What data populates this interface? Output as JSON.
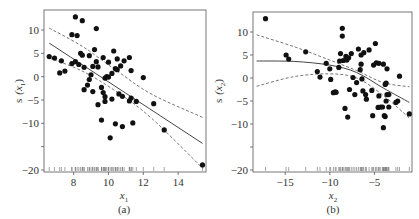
{
  "chart_data": [
    {
      "type": "scatter",
      "panel": "(a)",
      "xlabel": "x1",
      "ylabel": "s (x1)",
      "caption": "(a)",
      "xlim": [
        6.3,
        15.6
      ],
      "ylim": [
        -21,
        14
      ],
      "xticks": [
        8,
        10,
        12,
        14
      ],
      "yticks": [
        10,
        5,
        0,
        -5,
        -10,
        -15,
        -20
      ],
      "ytick_labels": [
        "10",
        "5",
        "0",
        "−5",
        "−10",
        "",
        "−20"
      ],
      "rug": true,
      "points": [
        [
          6.6,
          4.3
        ],
        [
          6.9,
          4.0
        ],
        [
          7.2,
          0.8
        ],
        [
          7.3,
          3.4
        ],
        [
          7.5,
          1.2
        ],
        [
          7.9,
          2.8
        ],
        [
          7.9,
          9.0
        ],
        [
          8.1,
          12.8
        ],
        [
          8.1,
          3.2
        ],
        [
          8.2,
          8.8
        ],
        [
          8.3,
          2.6
        ],
        [
          8.4,
          5.0
        ],
        [
          8.5,
          4.6
        ],
        [
          8.5,
          12.0
        ],
        [
          8.6,
          -2.8
        ],
        [
          8.6,
          2.0
        ],
        [
          8.8,
          -1.8
        ],
        [
          8.9,
          4.5
        ],
        [
          8.9,
          -0.6
        ],
        [
          9.0,
          0.4
        ],
        [
          9.1,
          -3.2
        ],
        [
          9.1,
          2.2
        ],
        [
          9.2,
          5.8
        ],
        [
          9.3,
          10.3
        ],
        [
          9.3,
          3.2
        ],
        [
          9.4,
          2.1
        ],
        [
          9.4,
          -6.0
        ],
        [
          9.6,
          -2.3
        ],
        [
          9.6,
          -9.3
        ],
        [
          9.7,
          -3.4
        ],
        [
          9.7,
          4.1
        ],
        [
          9.8,
          -0.3
        ],
        [
          9.8,
          -5.3
        ],
        [
          9.8,
          -4.3
        ],
        [
          9.9,
          0.0
        ],
        [
          10.0,
          3.1
        ],
        [
          10.0,
          -0.1
        ],
        [
          10.1,
          -13.1
        ],
        [
          10.2,
          -4.8
        ],
        [
          10.2,
          0.7
        ],
        [
          10.3,
          5.5
        ],
        [
          10.4,
          1.7
        ],
        [
          10.4,
          -10.1
        ],
        [
          10.5,
          3.8
        ],
        [
          10.5,
          1.5
        ],
        [
          10.6,
          -3.7
        ],
        [
          10.7,
          2.3
        ],
        [
          10.8,
          -4.2
        ],
        [
          10.8,
          -10.7
        ],
        [
          10.9,
          3.4
        ],
        [
          11.2,
          -5.2
        ],
        [
          11.2,
          4.1
        ],
        [
          11.3,
          1.3
        ],
        [
          11.3,
          -4.6
        ],
        [
          11.4,
          -9.9
        ],
        [
          11.6,
          -5.3
        ],
        [
          12.0,
          -0.2
        ],
        [
          12.6,
          -5.8
        ],
        [
          13.2,
          -11.4
        ],
        [
          15.4,
          -18.9
        ]
      ],
      "fit_line": [
        [
          6.6,
          7.2
        ],
        [
          15.4,
          -14.3
        ]
      ],
      "upper_band": [
        [
          6.6,
          10.4
        ],
        [
          8.5,
          6.5
        ],
        [
          10.5,
          1.2
        ],
        [
          12.5,
          -3.8
        ],
        [
          15.4,
          -8.7
        ]
      ],
      "lower_band": [
        [
          6.6,
          4.0
        ],
        [
          8.5,
          1.2
        ],
        [
          10.5,
          -3.3
        ],
        [
          12.5,
          -9.0
        ],
        [
          15.4,
          -19.6
        ]
      ]
    },
    {
      "type": "scatter",
      "panel": "(b)",
      "xlabel": "x2",
      "ylabel": "s (x2)",
      "caption": "(b)",
      "xlim": [
        -18.6,
        -0.8
      ],
      "ylim": [
        -21,
        14
      ],
      "xticks": [
        -15,
        -10,
        -5
      ],
      "yticks": [
        10,
        5,
        0,
        -5,
        -10,
        -15,
        -20
      ],
      "ytick_labels": [
        "10",
        "5",
        "0",
        "−5",
        "−10",
        "",
        "−20"
      ],
      "rug": true,
      "points": [
        [
          -17.2,
          12.9
        ],
        [
          -14.9,
          5.0
        ],
        [
          -14.6,
          4.1
        ],
        [
          -12.7,
          5.7
        ],
        [
          -11.4,
          1.4
        ],
        [
          -11.1,
          0.2
        ],
        [
          -10.4,
          3.2
        ],
        [
          -10.0,
          2.0
        ],
        [
          -9.9,
          -0.3
        ],
        [
          -9.6,
          -3.2
        ],
        [
          -9.4,
          -3.0
        ],
        [
          -9.3,
          -3.1
        ],
        [
          -9.0,
          2.3
        ],
        [
          -8.9,
          3.7
        ],
        [
          -8.8,
          5.3
        ],
        [
          -8.6,
          9.1
        ],
        [
          -8.6,
          10.8
        ],
        [
          -8.5,
          3.8
        ],
        [
          -8.3,
          -6.6
        ],
        [
          -8.2,
          4.7
        ],
        [
          -8.1,
          3.9
        ],
        [
          -8.0,
          -8.5
        ],
        [
          -7.9,
          4.4
        ],
        [
          -7.8,
          -2.5
        ],
        [
          -7.6,
          5.3
        ],
        [
          -7.4,
          0.1
        ],
        [
          -7.2,
          -3.6
        ],
        [
          -7.0,
          -1.0
        ],
        [
          -6.8,
          6.3
        ],
        [
          -6.6,
          1.8
        ],
        [
          -6.5,
          5.0
        ],
        [
          -6.5,
          3.0
        ],
        [
          -6.4,
          -0.2
        ],
        [
          -6.3,
          -2.8
        ],
        [
          -6.2,
          5.5
        ],
        [
          -6.0,
          -3.6
        ],
        [
          -5.9,
          -4.6
        ],
        [
          -5.6,
          6.1
        ],
        [
          -5.3,
          -2.7
        ],
        [
          -5.2,
          -8.2
        ],
        [
          -5.1,
          2.8
        ],
        [
          -4.9,
          7.5
        ],
        [
          -4.8,
          3.3
        ],
        [
          -4.6,
          -6.4
        ],
        [
          -4.5,
          -3.9
        ],
        [
          -4.5,
          3.2
        ],
        [
          -4.3,
          -6.3
        ],
        [
          -4.1,
          -6.3
        ],
        [
          -4.0,
          -10.8
        ],
        [
          -4.0,
          3.0
        ],
        [
          -3.9,
          -8.2
        ],
        [
          -3.8,
          -8.4
        ],
        [
          -3.8,
          -1.4
        ],
        [
          -3.7,
          -1.1
        ],
        [
          -3.7,
          -5.0
        ],
        [
          -3.6,
          -3.6
        ],
        [
          -3.6,
          2.0
        ],
        [
          -3.4,
          -3.6
        ],
        [
          -3.4,
          -6.3
        ],
        [
          -2.6,
          -5.3
        ],
        [
          -2.4,
          -5.0
        ],
        [
          -2.2,
          0.4
        ],
        [
          -1.1,
          -7.8
        ]
      ],
      "fit_line": [
        [
          -18.2,
          3.7
        ],
        [
          -14.0,
          3.6
        ],
        [
          -10.0,
          2.8
        ],
        [
          -7.0,
          1.2
        ],
        [
          -4.0,
          -2.2
        ],
        [
          -1.1,
          -5.3
        ]
      ],
      "upper_band": [
        [
          -18.2,
          9.4
        ],
        [
          -14.0,
          6.8
        ],
        [
          -10.0,
          3.9
        ],
        [
          -7.0,
          1.6
        ],
        [
          -4.0,
          -1.0
        ],
        [
          -1.1,
          -1.9
        ]
      ],
      "lower_band": [
        [
          -18.2,
          -1.8
        ],
        [
          -14.0,
          0.3
        ],
        [
          -10.0,
          0.9
        ],
        [
          -7.0,
          0.0
        ],
        [
          -4.0,
          -3.8
        ],
        [
          -1.1,
          -8.7
        ]
      ]
    }
  ],
  "panels": {
    "a": {
      "ylabel_prefix": "s",
      "ylabel_var": "(x",
      "ylabel_sub": "1",
      "ylabel_close": ")",
      "xlabel_var": "x",
      "xlabel_sub": "1",
      "caption": "(a)"
    },
    "b": {
      "ylabel_prefix": "s",
      "ylabel_var": "(x",
      "ylabel_sub": "2",
      "ylabel_close": ")",
      "xlabel_var": "x",
      "xlabel_sub": "2",
      "caption": "(b)"
    }
  }
}
